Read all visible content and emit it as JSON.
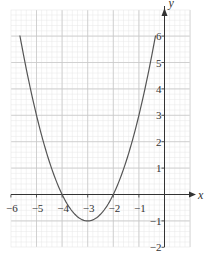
{
  "chart_data": {
    "type": "line",
    "title": "",
    "xlabel": "x",
    "ylabel": "y",
    "xlim": [
      -6,
      0.3
    ],
    "ylim": [
      -2,
      6.8
    ],
    "grid": true,
    "grid_minor_per_unit": 5,
    "x_ticks": [
      -6,
      -5,
      -4,
      -3,
      -2,
      -1
    ],
    "x_tick_labels": [
      "−6",
      "−5",
      "−4",
      "−3",
      "−2",
      "−1"
    ],
    "y_ticks": [
      -2,
      -1,
      1,
      2,
      3,
      4,
      5,
      6
    ],
    "y_tick_labels": [
      "−2",
      "−1",
      "1",
      "2",
      "3",
      "4",
      "5",
      "6"
    ],
    "series": [
      {
        "name": "y = (x + 3)^2 - 1",
        "equation": "y = x^2 + 6x + 8",
        "x_range": [
          -5.65,
          -0.35
        ],
        "vertex": [
          -3,
          -1
        ],
        "roots": [
          -4,
          -2
        ],
        "color": "#555555"
      }
    ]
  },
  "colors": {
    "grid_major": "#c8c8c8",
    "grid_minor": "#e6e6e6",
    "axis": "#333333",
    "curve": "#555555"
  }
}
